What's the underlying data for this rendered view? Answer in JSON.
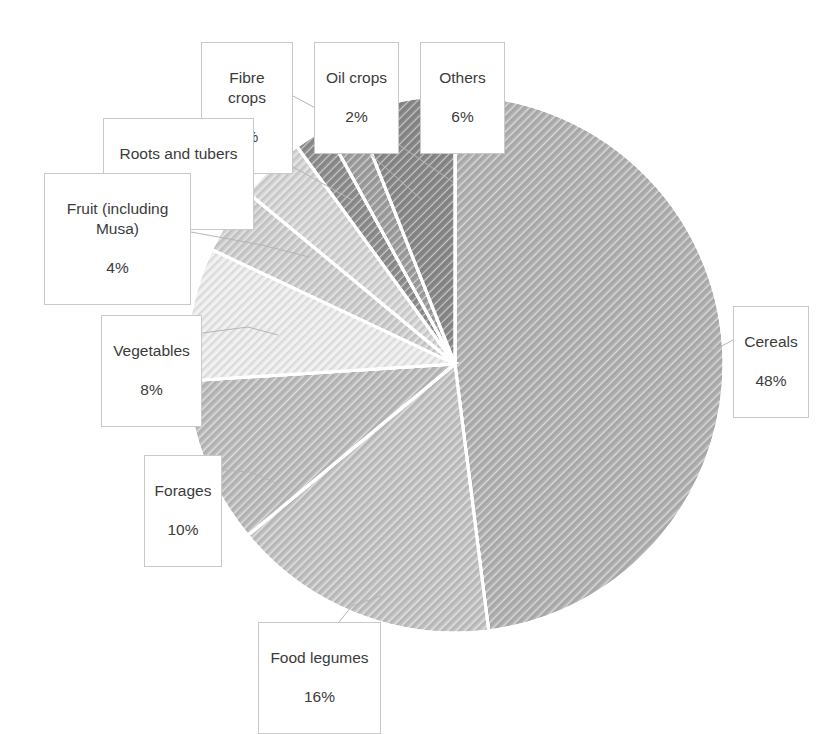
{
  "chart_data": {
    "type": "pie",
    "title": "",
    "subtitle": "",
    "xlabel": "",
    "ylabel": "",
    "legend_position": "none",
    "grid": false,
    "labels_format": "category name + percentage in callout boxes with leader lines",
    "start_angle_deg": 0,
    "direction": "clockwise",
    "categories": [
      "Cereals",
      "Food legumes",
      "Forages",
      "Vegetables",
      "Fruit (including Musa)",
      "Roots and tubers",
      "Fibre crops",
      "Oil crops",
      "Others"
    ],
    "values": [
      48,
      16,
      10,
      8,
      4,
      4,
      2,
      2,
      6
    ],
    "unit": "%",
    "total": 100,
    "slices": [
      {
        "label": "Cereals",
        "percent": 48,
        "percent_text": "48%",
        "color": "#b3b3b3",
        "pattern": "diagonal-hatch",
        "start_deg": 0,
        "end_deg": 172.8
      },
      {
        "label": "Food legumes",
        "percent": 16,
        "percent_text": "16%",
        "color": "#c4c4c4",
        "pattern": "diagonal-hatch",
        "start_deg": 172.8,
        "end_deg": 230.4
      },
      {
        "label": "Forages",
        "percent": 10,
        "percent_text": "10%",
        "color": "#bdbdbd",
        "pattern": "diagonal-hatch",
        "start_deg": 230.4,
        "end_deg": 266.4
      },
      {
        "label": "Vegetables",
        "percent": 8,
        "percent_text": "8%",
        "color": "#ececec",
        "pattern": "diagonal-hatch",
        "start_deg": 266.4,
        "end_deg": 295.2
      },
      {
        "label": "Fruit (including Musa)",
        "percent": 4,
        "percent_text": "4%",
        "color": "#cfcfcf",
        "pattern": "diagonal-hatch",
        "start_deg": 295.2,
        "end_deg": 309.6
      },
      {
        "label": "Roots and tubers",
        "percent": 4,
        "percent_text": "4%",
        "color": "#d6d6d6",
        "pattern": "diagonal-hatch",
        "start_deg": 309.6,
        "end_deg": 324
      },
      {
        "label": "Fibre crops",
        "percent": 2,
        "percent_text": "2%",
        "color": "#8f8f8f",
        "pattern": "diagonal-hatch",
        "start_deg": 324,
        "end_deg": 331.2
      },
      {
        "label": "Oil crops",
        "percent": 2,
        "percent_text": "2%",
        "color": "#a0a0a0",
        "pattern": "diagonal-hatch",
        "start_deg": 331.2,
        "end_deg": 338.4
      },
      {
        "label": "Others",
        "percent": 6,
        "percent_text": "6%",
        "color": "#8a8a8a",
        "pattern": "diagonal-hatch",
        "start_deg": 338.4,
        "end_deg": 360
      }
    ]
  },
  "callouts": {
    "fibre_crops": {
      "label": "Fibre crops",
      "percent_text": "2%"
    },
    "oil_crops": {
      "label": "Oil crops",
      "percent_text": "2%"
    },
    "others": {
      "label": "Others",
      "percent_text": "6%"
    },
    "roots_and_tubers": {
      "label": "Roots and tubers",
      "percent_text": "4%"
    },
    "fruit": {
      "label": "Fruit (including\nMusa)",
      "percent_text": "4%"
    },
    "vegetables": {
      "label": "Vegetables",
      "percent_text": "8%"
    },
    "forages": {
      "label": "Forages",
      "percent_text": "10%"
    },
    "food_legumes": {
      "label": "Food legumes",
      "percent_text": "16%"
    },
    "cereals": {
      "label": "Cereals",
      "percent_text": "48%"
    }
  },
  "style": {
    "background": "#ffffff",
    "slice_border": "#ffffff",
    "callout_border": "#c9c9c9",
    "leader_line": "#b5b5b5",
    "text_color": "#3b3b3b"
  }
}
